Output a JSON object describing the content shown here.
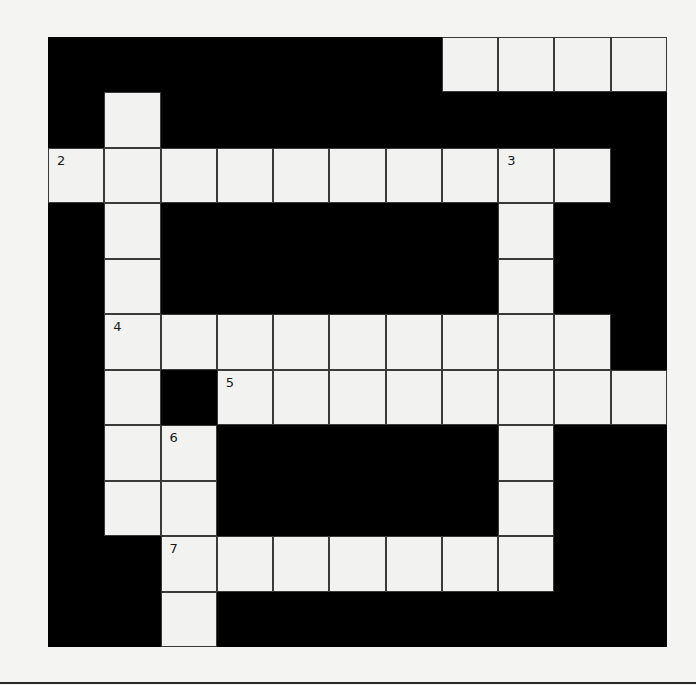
{
  "puzzle": {
    "type": "crossword",
    "rows": 11,
    "cols": 11,
    "colors": {
      "block": "#000000",
      "cell": "#f2f2f1",
      "background": "#f4f4f3",
      "grid_line": "#3a3a3a"
    },
    "layout": [
      "#######....",
      "#.#########",
      "..........#",
      "#.######.##",
      "#.######.##",
      "#.........#",
      "#.#........",
      "#..#####.##",
      "#..#####.##",
      "##.......##",
      "##.########"
    ],
    "white_cells_note": "'.' = white entry cell, '#' = black block",
    "numbers": [
      {
        "row": 0,
        "col": 1,
        "label": "1"
      },
      {
        "row": 2,
        "col": 0,
        "label": "2"
      },
      {
        "row": 2,
        "col": 8,
        "label": "3"
      },
      {
        "row": 5,
        "col": 1,
        "label": "4"
      },
      {
        "row": 6,
        "col": 3,
        "label": "5"
      },
      {
        "row": 7,
        "col": 2,
        "label": "6"
      },
      {
        "row": 9,
        "col": 2,
        "label": "7"
      }
    ],
    "entries": {
      "across": [
        {
          "number": "1",
          "row": 0,
          "col": 1,
          "length": 6
        },
        {
          "number": "2",
          "row": 2,
          "col": 0,
          "length": 10
        },
        {
          "number": "4",
          "row": 5,
          "col": 1,
          "length": 9
        },
        {
          "number": "5",
          "row": 6,
          "col": 3,
          "length": 8
        },
        {
          "number": "7",
          "row": 9,
          "col": 2,
          "length": 7
        }
      ],
      "down": [
        {
          "number": "1",
          "row": 0,
          "col": 1,
          "length": 9
        },
        {
          "number": "3",
          "row": 2,
          "col": 8,
          "length": 8
        },
        {
          "number": "6",
          "row": 7,
          "col": 2,
          "length": 4
        }
      ]
    }
  }
}
